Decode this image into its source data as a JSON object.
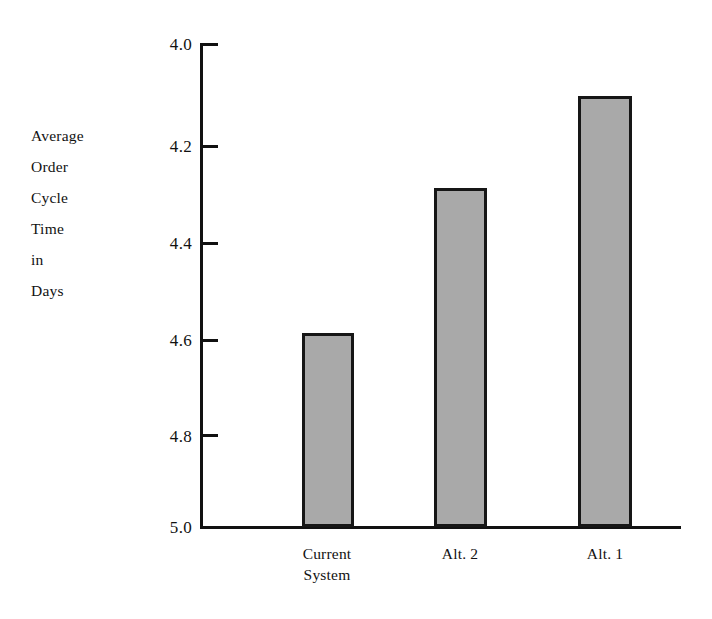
{
  "chart_data": {
    "type": "bar",
    "title": "",
    "subtitle": "",
    "xlabel": "",
    "ylabel": "Average Order Cycle Time in Days",
    "ylabel_lines": [
      "Average",
      "Order",
      "Cycle",
      "Time",
      "in",
      "Days"
    ],
    "categories": [
      "Current System",
      "Alt. 2",
      "Alt. 1"
    ],
    "category_lines": [
      [
        "Current",
        "System"
      ],
      [
        "Alt. 2"
      ],
      [
        "Alt. 1"
      ]
    ],
    "values": [
      4.6,
      4.3,
      4.11
    ],
    "ylim": [
      4.0,
      5.0
    ],
    "y_axis_inverted": true,
    "y_ticks": [
      "4.0",
      "4.2",
      "4.4",
      "4.6",
      "4.8",
      "5.0"
    ],
    "y_tick_values": [
      4.0,
      4.2,
      4.4,
      4.6,
      4.8,
      5.0
    ],
    "grid": false,
    "legend": false,
    "legend_position": "none",
    "bar_fill_color": "#a9a9a9",
    "bar_edge_color": "#161616",
    "axis_color": "#111111",
    "background_color": "#ffffff"
  }
}
